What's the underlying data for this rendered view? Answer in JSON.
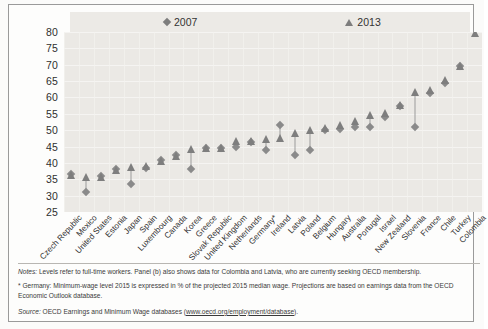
{
  "legend": {
    "items": [
      {
        "label": "2007",
        "marker": "diamond-marker"
      },
      {
        "label": "2013",
        "marker": "triangle-marker"
      }
    ]
  },
  "chart_data": {
    "type": "scatter",
    "title": "",
    "xlabel": "",
    "ylabel": "",
    "ylim": [
      25,
      80
    ],
    "yticks": [
      80,
      75,
      70,
      65,
      60,
      55,
      50,
      45,
      40,
      35,
      30,
      25
    ],
    "grid": true,
    "legend_position": "top",
    "categories": [
      "Czech Republic",
      "Mexico",
      "United States",
      "Estonia",
      "Japan",
      "Spain",
      "Luxembourg",
      "Canada",
      "Korea",
      "Greece",
      "Slovak Republic",
      "United Kingdom",
      "Netherlands",
      "Germany*",
      "Ireland",
      "Latvia",
      "Poland",
      "Belgium",
      "Hungary",
      "Australia",
      "Portugal",
      "Israel",
      "New Zealand",
      "Slovenia",
      "France",
      "Chile",
      "Turkey",
      "Colombia"
    ],
    "series": [
      {
        "name": "2007",
        "marker": "diamond",
        "color": "#8a8a8a",
        "values": [
          36.5,
          31.0,
          36.0,
          38.0,
          33.5,
          38.5,
          41.0,
          42.5,
          38.0,
          44.5,
          44.5,
          45.0,
          46.5,
          44.0,
          51.5,
          42.5,
          44.0,
          50.0,
          50.5,
          51.0,
          51.0,
          54.0,
          57.5,
          51.0,
          61.5,
          64.5,
          69.5,
          null
        ]
      },
      {
        "name": "2013",
        "marker": "triangle",
        "color": "#7e7e7e",
        "values": [
          36.5,
          36.0,
          36.0,
          38.0,
          39.0,
          39.5,
          41.0,
          42.5,
          44.5,
          45.0,
          45.0,
          47.0,
          47.0,
          47.5,
          48.0,
          49.5,
          50.5,
          51.0,
          52.0,
          53.0,
          55.0,
          55.5,
          58.0,
          62.0,
          62.5,
          65.5,
          70.0,
          80.0
        ]
      }
    ]
  },
  "notes": {
    "notes_label": "Notes:",
    "notes_text": " Levels refer to full-time workers. Panel (b) also shows data for Colombia and Latvia, who are currently seeking OECD membership.",
    "germany_note": "* Germany: Minimum-wage level 2015 is expressed in % of the projected 2015 median wage. Projections are based on earnings data from the OECD Economic Outlook database.",
    "source_label": "Source:",
    "source_text": " OECD Earnings and Minimum Wage databases (",
    "source_link": "www.oecd.org/employment/database",
    "source_tail": ")."
  }
}
